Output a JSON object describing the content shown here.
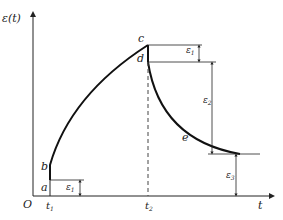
{
  "diagram": {
    "y_axis_label": "ε(t)",
    "x_axis_label": "t",
    "origin_label": "O",
    "time_labels": {
      "t1": "t",
      "t1_sub": "1",
      "t2": "t",
      "t2_sub": "2"
    },
    "points": {
      "a": "a",
      "b": "b",
      "c": "c",
      "d": "d",
      "e": "e"
    },
    "strains": {
      "e1_low": {
        "main": "ε",
        "sub": "1"
      },
      "e1_high": {
        "main": "ε",
        "sub": "1"
      },
      "e2": {
        "main": "ε",
        "sub": "2"
      },
      "e3": {
        "main": "ε",
        "sub": "3"
      }
    }
  }
}
